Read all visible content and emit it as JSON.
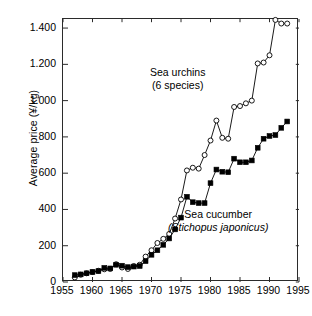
{
  "chart_data": {
    "type": "line",
    "title": "",
    "xlabel": "",
    "ylabel": "Average price (¥/kg)",
    "xlim": [
      1955,
      1995
    ],
    "ylim": [
      0,
      1450
    ],
    "xticks": [
      1955,
      1960,
      1965,
      1970,
      1975,
      1980,
      1985,
      1990,
      1995
    ],
    "xticklabels": [
      "1955",
      "1960",
      "1965",
      "1970",
      "1975",
      "1980",
      "1985",
      "1990",
      "1995"
    ],
    "yticks": [
      0,
      200,
      400,
      600,
      800,
      1000,
      1200,
      1400
    ],
    "yticklabels": [
      "0",
      "200",
      "400",
      "600",
      "800",
      "1.000",
      "1.200",
      "1.400"
    ],
    "grid": false,
    "legend_position": "inline-annotations",
    "annotations": [
      {
        "name": "sea-urchins",
        "line1": "Sea urchins",
        "line2": "(6 species)",
        "italic_line2": false
      },
      {
        "name": "sea-cucumber",
        "line1": "Sea cucumber",
        "line2": "(Stichopus japonicus)",
        "italic_line2": true
      }
    ],
    "series": [
      {
        "name": "Sea urchins (6 species)",
        "marker": "open-circle",
        "color": "#000000",
        "x": [
          1957,
          1958,
          1959,
          1960,
          1961,
          1962,
          1963,
          1964,
          1965,
          1966,
          1967,
          1968,
          1969,
          1970,
          1971,
          1972,
          1973,
          1974,
          1975,
          1976,
          1977,
          1978,
          1979,
          1980,
          1981,
          1982,
          1983,
          1984,
          1985,
          1986,
          1987,
          1988,
          1989,
          1990,
          1991,
          1992,
          1993
        ],
        "y": [
          25,
          40,
          48,
          55,
          62,
          70,
          72,
          98,
          80,
          72,
          88,
          95,
          140,
          175,
          215,
          238,
          265,
          350,
          455,
          615,
          630,
          625,
          700,
          780,
          890,
          795,
          790,
          965,
          970,
          985,
          1000,
          1205,
          1210,
          1250,
          1445,
          1425,
          1425
        ]
      },
      {
        "name": "Sea cucumber (Stichopus japonicus)",
        "marker": "filled-square",
        "color": "#000000",
        "x": [
          1957,
          1958,
          1959,
          1960,
          1961,
          1962,
          1963,
          1964,
          1965,
          1966,
          1967,
          1968,
          1969,
          1970,
          1971,
          1972,
          1973,
          1974,
          1975,
          1976,
          1977,
          1978,
          1979,
          1980,
          1981,
          1982,
          1983,
          1984,
          1985,
          1986,
          1987,
          1988,
          1989,
          1990,
          1991,
          1992,
          1993
        ],
        "y": [
          38,
          42,
          48,
          55,
          60,
          78,
          75,
          95,
          90,
          82,
          85,
          88,
          115,
          150,
          175,
          205,
          240,
          290,
          355,
          470,
          440,
          435,
          435,
          545,
          620,
          608,
          605,
          680,
          660,
          660,
          670,
          740,
          790,
          805,
          810,
          850,
          885
        ]
      }
    ]
  }
}
